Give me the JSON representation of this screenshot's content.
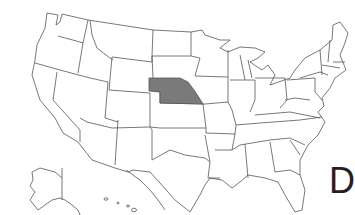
{
  "map": {
    "subject": "United States state outline map",
    "highlighted_state": "Nebraska",
    "highlight_color": "#7a7a7a",
    "outline_color": "#555555",
    "background_color": "#ffffff"
  },
  "label": {
    "letter": "D"
  }
}
